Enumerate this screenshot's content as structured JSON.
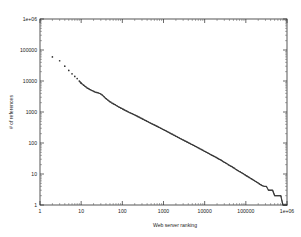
{
  "figure": {
    "background_color": "#ffffff",
    "frame_color": "#2b2b2b",
    "marker_color": "#333333"
  },
  "chart_data": {
    "type": "scatter",
    "title": "",
    "subtitle": "",
    "xlabel": "Web server ranking",
    "ylabel": "# of references",
    "xscale": "log",
    "yscale": "log",
    "xlim": [
      1,
      1000000
    ],
    "ylim": [
      1,
      1000000
    ],
    "grid": false,
    "legend": null,
    "legend_position": "none",
    "xticks": [
      1,
      10,
      100,
      1000,
      10000,
      100000,
      1000000
    ],
    "xticklabels": [
      "1",
      "10",
      "100",
      "1000",
      "10000",
      "100000",
      "1e+06"
    ],
    "yticks": [
      1,
      10,
      100,
      1000,
      10000,
      100000,
      1000000
    ],
    "yticklabels": [
      "1",
      "10",
      "100",
      "1000",
      "10000",
      "100000",
      "1e+06"
    ],
    "marker": "point",
    "marker_size": 1,
    "series": [
      {
        "name": "references per server",
        "x": [
          2,
          3,
          4,
          5,
          6,
          7,
          8,
          9,
          10,
          12,
          14,
          16,
          18,
          20,
          22,
          25,
          28,
          32,
          36,
          40,
          45,
          50,
          56,
          63,
          71,
          79,
          89,
          100,
          112,
          126,
          141,
          158,
          178,
          200,
          224,
          251,
          282,
          316,
          355,
          398,
          447,
          501,
          562,
          631,
          708,
          794,
          891,
          1000,
          1122,
          1259,
          1413,
          1585,
          1778,
          1995,
          2239,
          2512,
          2818,
          3162,
          3548,
          3981,
          4467,
          5012,
          5623,
          6310,
          7079,
          7943,
          8913,
          10000,
          11220,
          12589,
          14125,
          15849,
          17783,
          19953,
          22387,
          25119,
          28184,
          31623,
          35481,
          39811,
          44668,
          50119,
          56234,
          63096,
          70795,
          79433,
          89125,
          100000,
          112202,
          125893,
          141254,
          158489,
          177828,
          199526,
          223872,
          251189,
          281838,
          316228,
          354813,
          398107,
          446684,
          501187,
          562341,
          630957,
          707946,
          794328,
          891251,
          1000000
        ],
        "y": [
          60000,
          45000,
          30000,
          22000,
          17000,
          14000,
          12000,
          10000,
          8500,
          7000,
          6000,
          5400,
          5000,
          4700,
          4400,
          4200,
          4000,
          3600,
          3100,
          2700,
          2400,
          2150,
          1950,
          1800,
          1650,
          1500,
          1380,
          1270,
          1170,
          1080,
          1000,
          930,
          865,
          800,
          745,
          690,
          640,
          590,
          545,
          505,
          465,
          430,
          400,
          370,
          342,
          316,
          292,
          270,
          249,
          230,
          212,
          196,
          181,
          167,
          154,
          142,
          131,
          121,
          112,
          103,
          95,
          88,
          81,
          75,
          69,
          64,
          59,
          54,
          50,
          46,
          42,
          39,
          36,
          33,
          30,
          28,
          25,
          23,
          21,
          19,
          17.5,
          16,
          14.5,
          13,
          12,
          11,
          10,
          9,
          8.2,
          7.5,
          6.8,
          6.2,
          5.6,
          5.1,
          4.6,
          4.2,
          4,
          4,
          3,
          3,
          3,
          2,
          2,
          2,
          2,
          1,
          1,
          1
        ]
      }
    ]
  }
}
